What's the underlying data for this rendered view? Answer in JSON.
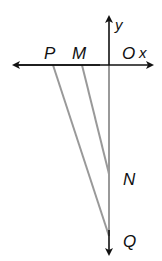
{
  "diagram": {
    "type": "coordinate-geometry",
    "axes": {
      "x_label": "x",
      "y_label": "y",
      "origin_label": "O"
    },
    "points": [
      {
        "name": "P",
        "label": "P"
      },
      {
        "name": "M",
        "label": "M"
      },
      {
        "name": "O",
        "label": "O"
      },
      {
        "name": "N",
        "label": "N"
      },
      {
        "name": "Q",
        "label": "Q"
      }
    ],
    "segments": [
      "PQ",
      "MN",
      "OQ"
    ],
    "colors": {
      "axis": "#111111",
      "segment": "#999999"
    }
  }
}
